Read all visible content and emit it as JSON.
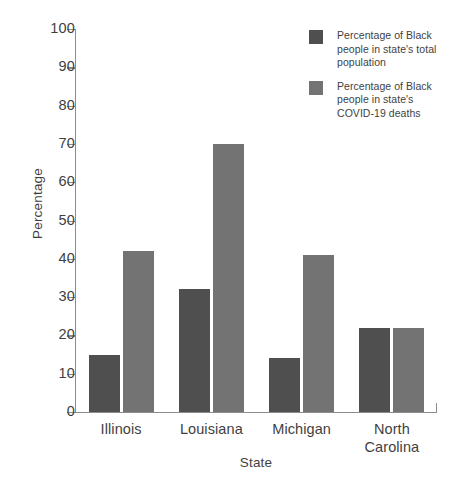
{
  "chart_data": {
    "type": "bar",
    "title": "",
    "xlabel": "State",
    "ylabel": "Percentage",
    "categories": [
      "Illinois",
      "Louisiana",
      "Michigan",
      "North Carolina"
    ],
    "category_label_lines": [
      [
        "Illinois"
      ],
      [
        "Louisiana"
      ],
      [
        "Michigan"
      ],
      [
        "North",
        "Carolina"
      ]
    ],
    "series": [
      {
        "name": "Percentage of Black people in state's total population",
        "color": "#4f4f4f",
        "values": [
          15,
          32,
          14,
          22
        ]
      },
      {
        "name": "Percentage of Black people in state's COVID-19 deaths",
        "color": "#737373",
        "values": [
          42,
          70,
          41,
          22
        ]
      }
    ],
    "ylim": [
      0,
      100
    ],
    "ytick_values": [
      0,
      10,
      20,
      30,
      40,
      50,
      60,
      70,
      80,
      90,
      100
    ],
    "ytick_labels": [
      "0",
      "10",
      "20",
      "30",
      "40",
      "50",
      "60",
      "70",
      "80",
      "90",
      "100"
    ],
    "grid": false,
    "legend_position": "top-right"
  },
  "legend": {
    "entries": [
      {
        "swatch": "dark-gray-swatch",
        "lines": [
          "Percentage of Black",
          "people in state's total",
          "population"
        ]
      },
      {
        "swatch": "medium-gray-swatch",
        "lines": [
          "Percentage of Black",
          "people in state's",
          "COVID-19 deaths"
        ]
      }
    ]
  },
  "axes": {
    "y_title": "Percentage",
    "x_title": "State"
  }
}
